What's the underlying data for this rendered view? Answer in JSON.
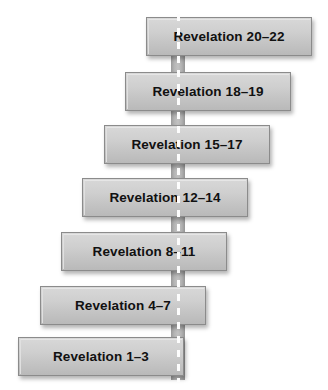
{
  "diagram": {
    "type": "vertical-staircase-flow",
    "orientation": "descending-left",
    "background_color": "#ffffff",
    "spine": {
      "name": "vertical-dashed-connector",
      "color": "#b4b4b4",
      "dash_color": "#fdfdfd",
      "center_x": 178,
      "top": 14,
      "bottom": 382
    },
    "node_style": {
      "fill_top": "#d8d8d8",
      "fill_bottom": "#b9b9b9",
      "border_color": "#8b8b8b",
      "text_color": "#111111",
      "shadow_color": "rgba(0,0,0,0.30)",
      "width": 166,
      "height": 39
    },
    "nodes": [
      {
        "id": "node-1",
        "label": "Revelation 20–22",
        "left": 146,
        "top": 17
      },
      {
        "id": "node-2",
        "label": "Revelation 18–19",
        "left": 125,
        "top": 72
      },
      {
        "id": "node-3",
        "label": "Revelation 15–17",
        "left": 104,
        "top": 125
      },
      {
        "id": "node-4",
        "label": "Revelation 12–14",
        "left": 82,
        "top": 178
      },
      {
        "id": "node-5",
        "label": "Revelation 8–11",
        "left": 61,
        "top": 232
      },
      {
        "id": "node-6",
        "label": "Revelation 4–7",
        "left": 40,
        "top": 286
      },
      {
        "id": "node-7",
        "label": "Revelation 1–3",
        "left": 18,
        "top": 337
      }
    ]
  }
}
